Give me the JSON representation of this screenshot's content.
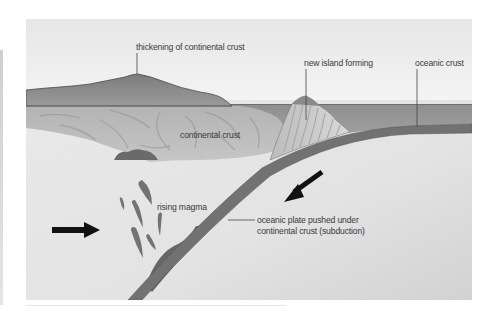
{
  "diagram": {
    "type": "cross-section",
    "labels": {
      "thickening": "thickening of continental crust",
      "island": "new island forming",
      "oceanic_crust": "oceanic crust",
      "continental_crust": "continental crust",
      "rising_magma": "rising magma",
      "subduction_line1": "oceanic plate pushed under",
      "subduction_line2": "continental crust (subduction)"
    },
    "arrows": [
      {
        "name": "plate-motion-arrow-left",
        "direction": "right"
      },
      {
        "name": "plate-motion-arrow-right",
        "direction": "down-left"
      }
    ],
    "colors": {
      "sky": "#f2f2f2",
      "land": "#8a8a8a",
      "sea": "#9c9c9c",
      "continental_crust": "#bdbdbd",
      "mantle": "#e4e4e4",
      "oceanic_plate": "#6e6e6e",
      "magma": "#6a6a6a",
      "arrow": "#111111",
      "text": "#3a3a3a"
    }
  }
}
